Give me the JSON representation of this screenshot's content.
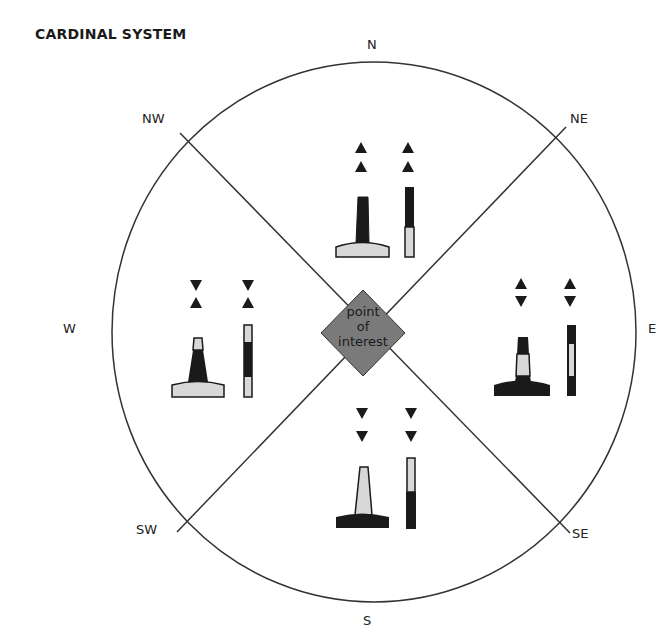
{
  "title": "CARDINAL SYSTEM",
  "directions": {
    "n": "N",
    "ne": "NE",
    "e": "E",
    "se": "SE",
    "s": "S",
    "sw": "SW",
    "w": "W",
    "nw": "NW"
  },
  "center": {
    "line1": "point",
    "line2": "of",
    "line3": "interest",
    "fill": "#7a7a7a"
  },
  "colors": {
    "black": "#1a1a1a",
    "yellow_light": "#d8d8d8",
    "line": "#333333"
  },
  "marks": [
    {
      "sector": "north",
      "topmark": "two cones pointing up",
      "colors": "black over yellow"
    },
    {
      "sector": "east",
      "topmark": "cones base to base",
      "colors": "black yellow black"
    },
    {
      "sector": "south",
      "topmark": "two cones pointing down",
      "colors": "yellow over black"
    },
    {
      "sector": "west",
      "topmark": "cones point to point",
      "colors": "yellow black yellow"
    }
  ]
}
